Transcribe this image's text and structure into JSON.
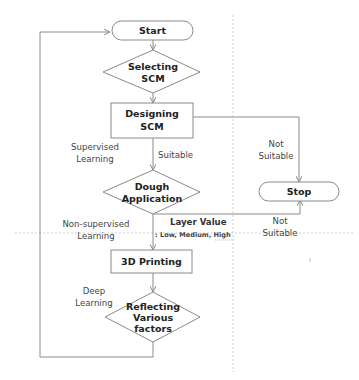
{
  "diagram": {
    "type": "flowchart",
    "nodes": {
      "start": {
        "shape": "terminal",
        "label": "Start"
      },
      "selecting": {
        "shape": "decision",
        "lines": [
          "Selecting",
          "SCM"
        ]
      },
      "designing": {
        "shape": "process",
        "lines": [
          "Designing",
          "SCM"
        ]
      },
      "dough": {
        "shape": "decision",
        "lines": [
          "Dough",
          "Application"
        ]
      },
      "stop": {
        "shape": "terminal",
        "label": "Stop"
      },
      "printing": {
        "shape": "process",
        "label": "3D Printing"
      },
      "reflecting": {
        "shape": "decision",
        "lines": [
          "Reflecting",
          "Various",
          "factors"
        ]
      }
    },
    "edge_labels": {
      "supervised": [
        "Supervised",
        "Learning"
      ],
      "suitable": "Suitable",
      "not_suitable_top": [
        "Not",
        "Suitable"
      ],
      "non_supervised": [
        "Non-supervised",
        "Learning"
      ],
      "layer_value": "Layer Value",
      "layer_levels": ": Low, Medium, High",
      "not_suitable_bottom": [
        "Not",
        "Suitable"
      ],
      "deep": [
        "Deep",
        "Learning"
      ]
    },
    "colors": {
      "stroke": "#8a8a8a",
      "text": "#222222",
      "dashed": "#c8c8c8"
    }
  }
}
